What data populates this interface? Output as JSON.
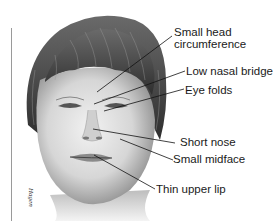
{
  "figure": {
    "signature": "Hagen",
    "labels": [
      {
        "id": "head",
        "line1": "Small head",
        "line2": "circumference"
      },
      {
        "id": "nasal-bridge",
        "line1": "Low nasal bridge"
      },
      {
        "id": "eye-folds",
        "line1": "Eye folds"
      },
      {
        "id": "nose",
        "line1": "Short nose"
      },
      {
        "id": "midface",
        "line1": "Small midface"
      },
      {
        "id": "lip",
        "line1": "Thin upper lip"
      }
    ]
  }
}
